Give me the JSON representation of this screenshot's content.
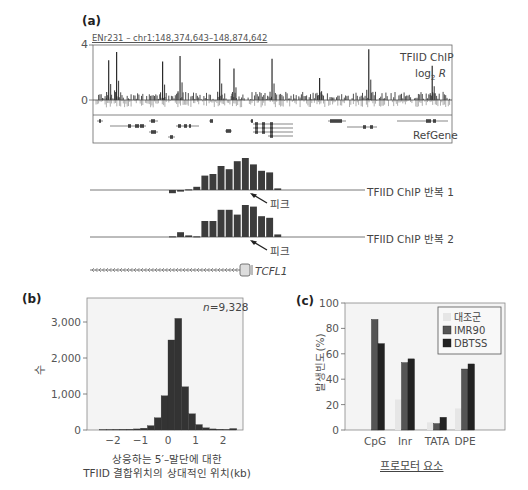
{
  "panel_a": {
    "label": "(a)",
    "region": "ENr231 – chr1:148,374,643–148,874,642",
    "y_tick_top": "4",
    "y_tick_zero": "0",
    "track_title": "TFIID ChIP",
    "track_unit_prefix": "log",
    "track_unit_sub": "2",
    "track_unit_var": "R",
    "gene_track_label": "RefGene",
    "rep1_label": "TFIID ChIP 반복 1",
    "rep2_label": "TFIID ChIP 반복 2",
    "peak_label_1": "피크",
    "peak_label_2": "피크",
    "gene_name": "TCFL1"
  },
  "panel_b": {
    "label": "(b)",
    "n_label": "n=9,328",
    "y_label": "수",
    "y_ticks": [
      "0",
      "1,000",
      "2,000",
      "3,000"
    ],
    "x_ticks": [
      "−2",
      "−1",
      "0",
      "1",
      "2"
    ],
    "x_label_line1": "상응하는 5′–말단에 대한",
    "x_label_line2": "TFIID 결합위치의 상대적인 위치(kb)"
  },
  "panel_c": {
    "label": "(c)",
    "y_label": "발생빈도(%)",
    "y_ticks": [
      "0",
      "20",
      "40",
      "60",
      "80",
      "100"
    ],
    "x_label": "프로모터 요소",
    "categories": [
      "CpG",
      "Inr",
      "TATA",
      "DPE"
    ],
    "legend": [
      {
        "name": "대조군",
        "color": "#e6e6e6"
      },
      {
        "name": "IMR90",
        "color": "#555555"
      },
      {
        "name": "DBTSS",
        "color": "#222222"
      }
    ]
  },
  "colors": {
    "bar_dark": "#3a3a3a",
    "bar_mid": "#555555",
    "bar_light": "#e8e8e8",
    "axis": "#777777",
    "plot_bg": "#f4f4f4",
    "neg_signal": "#9a9a9a"
  },
  "chart_data": [
    {
      "type": "bar",
      "title": "TFIID ChIP log2 R across ENr231 – chr1:148,374,643–148,874,642",
      "xlabel": "genomic position",
      "ylabel": "log2 R",
      "ylim": [
        -1,
        4
      ],
      "peaks_approx": [
        {
          "x_frac": 0.04,
          "value": 2.9
        },
        {
          "x_frac": 0.065,
          "value": 3.5
        },
        {
          "x_frac": 0.21,
          "value": 2.8
        },
        {
          "x_frac": 0.265,
          "value": 3.2
        },
        {
          "x_frac": 0.39,
          "value": 3.0
        },
        {
          "x_frac": 0.435,
          "value": 2.3
        },
        {
          "x_frac": 0.555,
          "value": 3.0
        },
        {
          "x_frac": 0.705,
          "value": 1.6
        },
        {
          "x_frac": 0.86,
          "value": 3.7
        },
        {
          "x_frac": 1.06,
          "value": 2.5
        }
      ],
      "tracks": [
        "TFIID ChIP log2 R",
        "RefGene"
      ]
    },
    {
      "type": "bar",
      "title": "TFIID ChIP replicate zoom at TCFL1 promoter",
      "series": [
        {
          "name": "TFIID ChIP 반복 1",
          "values": [
            -0.1,
            -0.05,
            0.02,
            0.1,
            0.45,
            0.5,
            0.75,
            0.65,
            0.9,
            1.0,
            0.8,
            0.6,
            0.55,
            0.05
          ]
        },
        {
          "name": "TFIID ChIP 반복 2",
          "values": [
            0.02,
            0.15,
            0.05,
            0.02,
            0.5,
            0.5,
            0.85,
            0.85,
            0.7,
            1.0,
            0.95,
            0.65,
            0.6,
            0.08
          ]
        }
      ],
      "annotations": [
        "피크",
        "TCFL1"
      ]
    },
    {
      "type": "bar",
      "title": "Histogram of TFIID binding site positions",
      "xlabel": "상응하는 5′–말단에 대한 TFIID 결합위치의 상대적인 위치(kb)",
      "ylabel": "수",
      "annotation": "n=9,328",
      "x_bin_starts": [
        -2.5,
        -2.25,
        -2.0,
        -1.75,
        -1.5,
        -1.25,
        -1.0,
        -0.75,
        -0.5,
        -0.25,
        0.0,
        0.25,
        0.5,
        0.75,
        1.0,
        1.25,
        1.5,
        1.75,
        2.0,
        2.25
      ],
      "values": [
        10,
        12,
        15,
        18,
        20,
        30,
        50,
        120,
        340,
        950,
        2500,
        3100,
        1200,
        450,
        150,
        60,
        30,
        20,
        15,
        40
      ],
      "xlim": [
        -2.7,
        2.7
      ],
      "ylim": [
        0,
        3500
      ],
      "x_ticks": [
        -2,
        -1,
        0,
        1,
        2
      ],
      "y_ticks": [
        0,
        1000,
        2000,
        3000
      ]
    },
    {
      "type": "bar",
      "title": "Promoter element occurrence",
      "categories": [
        "CpG",
        "Inr",
        "TATA",
        "DPE"
      ],
      "series": [
        {
          "name": "대조군",
          "values": [
            0,
            24,
            6,
            17
          ]
        },
        {
          "name": "IMR90",
          "values": [
            87,
            53,
            5,
            48
          ]
        },
        {
          "name": "DBTSS",
          "values": [
            68,
            56,
            10,
            52
          ]
        }
      ],
      "xlabel": "프로모터 요소",
      "ylabel": "발생빈도(%)",
      "ylim": [
        0,
        100
      ],
      "legend_position": "upper right"
    }
  ]
}
